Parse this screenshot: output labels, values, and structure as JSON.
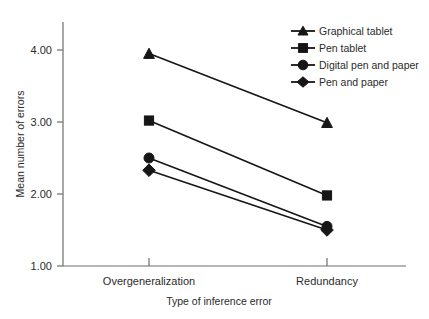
{
  "chart_data": {
    "type": "line",
    "title": "",
    "xlabel": "Type of inference error",
    "ylabel": "Mean number of errors",
    "categories": [
      "Overgeneralization",
      "Redundancy"
    ],
    "yticks": [
      "1.00",
      "2.00",
      "3.00",
      "4.00"
    ],
    "ytick_values": [
      1.0,
      2.0,
      3.0,
      4.0
    ],
    "ylim": [
      1.0,
      4.4
    ],
    "grid": false,
    "legend_position": "top-right",
    "series": [
      {
        "name": "Graphical tablet",
        "marker": "triangle",
        "values": [
          3.95,
          2.99
        ]
      },
      {
        "name": "Pen tablet",
        "marker": "square",
        "values": [
          3.02,
          1.98
        ]
      },
      {
        "name": "Digital pen and paper",
        "marker": "circle",
        "values": [
          2.5,
          1.55
        ]
      },
      {
        "name": "Pen and paper",
        "marker": "diamond",
        "values": [
          2.33,
          1.5
        ]
      }
    ],
    "colors": {
      "ink": "#161616",
      "axis": "#6e6e6e",
      "text": "#2b2b2b"
    }
  },
  "legend": {
    "items": [
      {
        "label": "Graphical tablet"
      },
      {
        "label": "Pen tablet"
      },
      {
        "label": "Digital pen and paper"
      },
      {
        "label": "Pen and paper"
      }
    ]
  },
  "axes": {
    "y_title": "Mean number of errors",
    "x_title": "Type of inference error",
    "y_tick_labels": [
      "4.00",
      "3.00",
      "2.00",
      "1.00"
    ],
    "x_tick_labels": [
      "Overgeneralization",
      "Redundancy"
    ]
  }
}
